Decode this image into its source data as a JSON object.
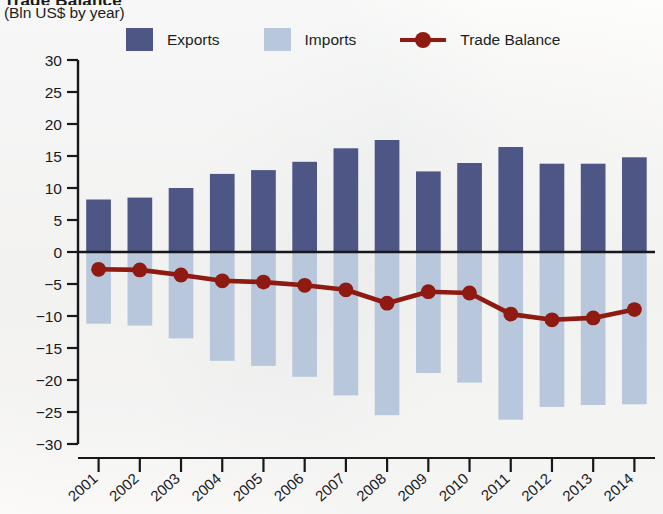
{
  "header": {
    "title": "Trade Balance",
    "subtitle": "(Bln US$ by year)"
  },
  "legend": {
    "position": "top",
    "items": [
      {
        "label": "Exports",
        "type": "bar",
        "color": "#4e5686"
      },
      {
        "label": "Imports",
        "type": "bar",
        "color": "#b8c7dc"
      },
      {
        "label": "Trade Balance",
        "type": "line",
        "color": "#8e1a12"
      }
    ]
  },
  "chart_data": {
    "type": "bar",
    "title": "Trade Balance",
    "subtitle": "(Bln US$ by year)",
    "xlabel": "",
    "ylabel": "",
    "unit": "Bln US$",
    "ylim": [
      -30,
      30
    ],
    "ytick_step": 5,
    "yticks": [
      30,
      25,
      20,
      15,
      10,
      5,
      0,
      -5,
      -10,
      -15,
      -20,
      -25,
      -30
    ],
    "ytick_labels": [
      "30",
      "25",
      "20",
      "15",
      "10",
      "5",
      "0",
      "−5",
      "−10",
      "−15",
      "−20",
      "−25",
      "−30"
    ],
    "grid": false,
    "zero_line": true,
    "categories": [
      "2001",
      "2002",
      "2003",
      "2004",
      "2005",
      "2006",
      "2007",
      "2008",
      "2009",
      "2010",
      "2011",
      "2012",
      "2013",
      "2014"
    ],
    "series": [
      {
        "name": "Exports",
        "type": "bar",
        "color": "#4e5686",
        "values": [
          8.2,
          8.5,
          10.0,
          12.2,
          12.8,
          14.1,
          16.2,
          17.5,
          12.6,
          13.9,
          16.4,
          13.8,
          13.8,
          14.8
        ]
      },
      {
        "name": "Imports",
        "type": "bar",
        "color": "#b8c7dc",
        "values": [
          -11.2,
          -11.5,
          -13.5,
          -17.0,
          -17.8,
          -19.5,
          -22.4,
          -25.5,
          -18.9,
          -20.4,
          -26.2,
          -24.2,
          -23.9,
          -23.8
        ]
      },
      {
        "name": "Trade Balance",
        "type": "line",
        "color": "#8e1a12",
        "marker": "circle",
        "values": [
          -2.7,
          -2.8,
          -3.6,
          -4.5,
          -4.7,
          -5.2,
          -5.9,
          -8.0,
          -6.2,
          -6.4,
          -9.7,
          -10.6,
          -10.3,
          -9.0
        ]
      }
    ]
  }
}
